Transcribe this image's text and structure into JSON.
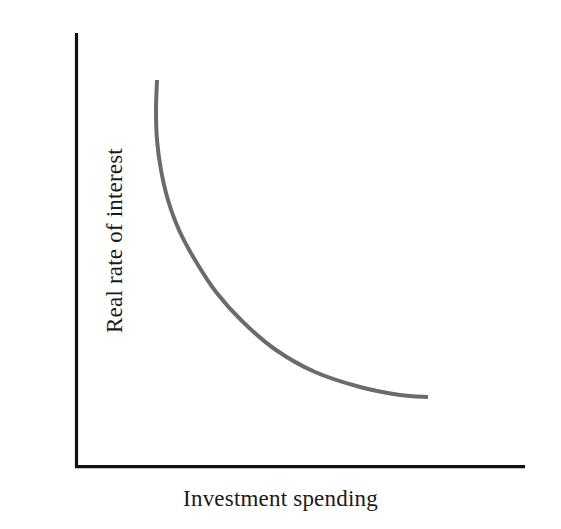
{
  "figure": {
    "background_color": "#ffffff",
    "axis_color": "#111111",
    "curve_color": "#6b6b6b",
    "x_axis_label": "Investment spending",
    "y_axis_label": "Real rate of interest"
  },
  "chart_data": {
    "type": "line",
    "title": "",
    "subtitle": "",
    "xlabel": "Investment spending",
    "ylabel": "Real rate of interest",
    "xlim": [
      0,
      100
    ],
    "ylim": [
      0,
      100
    ],
    "grid": false,
    "legend": null,
    "tick_labels": {
      "x": [],
      "y": []
    },
    "annotations": [],
    "series": [
      {
        "name": "Investment demand curve",
        "color": "#6b6b6b",
        "linewidth": 4,
        "shape": "downward-sloping convex hyperbola",
        "points_px": [
          [
            157,
            80
          ],
          [
            156,
            110
          ],
          [
            157,
            140
          ],
          [
            161,
            170
          ],
          [
            168,
            200
          ],
          [
            179,
            230
          ],
          [
            195,
            260
          ],
          [
            216,
            292
          ],
          [
            243,
            322
          ],
          [
            276,
            350
          ],
          [
            315,
            372
          ],
          [
            360,
            387
          ],
          [
            400,
            395
          ],
          [
            428,
            397
          ]
        ],
        "x": [
          18.2,
          18.0,
          18.2,
          19.1,
          20.7,
          23.1,
          26.7,
          31.3,
          37.3,
          44.7,
          53.3,
          63.3,
          72.2,
          78.4
        ],
        "values": [
          89.2,
          82.3,
          75.3,
          68.4,
          61.5,
          54.6,
          47.7,
          40.4,
          33.5,
          27.1,
          22.1,
          18.6,
          16.7,
          16.3
        ]
      }
    ],
    "axes_px": {
      "x_axis": {
        "x1": 75,
        "y1": 468,
        "x2": 525,
        "y2": 468
      },
      "y_axis": {
        "x1": 75,
        "y1": 33,
        "x2": 75,
        "y2": 468
      },
      "linewidth": 3
    }
  }
}
